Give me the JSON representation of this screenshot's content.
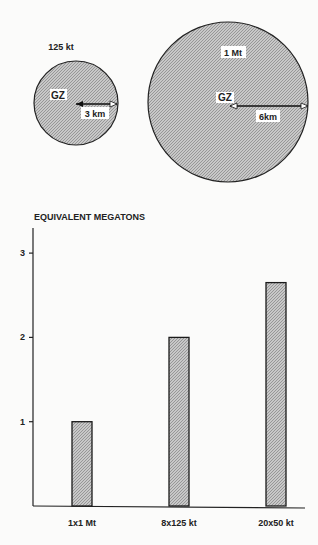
{
  "header_text": "OF NUCLEAR WEAPONS",
  "diagram": {
    "small_circle": {
      "label": "125 kt",
      "center_label": "GZ",
      "radius_label": "3 km"
    },
    "large_circle": {
      "label": "1 Mt",
      "center_label": "GZ",
      "radius_label": "6km"
    }
  },
  "chart_data": {
    "type": "bar",
    "title": "EQUIVALENT MEGATONS",
    "xlabel": "",
    "ylabel": "EQUIVALENT MEGATONS",
    "categories": [
      "1x1 Mt",
      "8x125 kt",
      "20x50 kt"
    ],
    "values": [
      1.0,
      2.0,
      2.65
    ],
    "yticks": [
      1,
      2,
      3
    ],
    "ylim": [
      0,
      3.3
    ],
    "grid": false,
    "legend": "none"
  },
  "colors": {
    "fill": "#bdbdbd",
    "stroke": "#1a1a1a"
  }
}
